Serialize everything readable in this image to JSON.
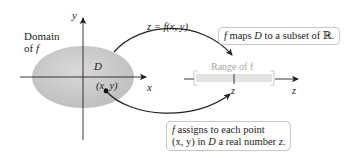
{
  "diagram": {
    "domain_label_line1": "Domain",
    "domain_label_line2_prefix": "of ",
    "domain_label_line2_var": "f",
    "region_label": "D",
    "point_label": "(x, y)",
    "x_axis_label": "x",
    "y_axis_label": "y",
    "z_axis_label": "z",
    "z_tick_label": "z",
    "mapping_label": "z = f(x, y)",
    "range_label": "Range of f",
    "callout_top": {
      "f": "f",
      "text1": " maps ",
      "D": "D",
      "text2": " to a subset of ℝ."
    },
    "callout_bottom": {
      "f": "f",
      "line1": " assigns to each point",
      "line2_xy": "(x, y)",
      "line2_mid": " in ",
      "line2_D": "D",
      "line2_end": " a real number ",
      "line2_z": "z",
      "line2_period": "."
    },
    "colors": {
      "domain_fill": "#c8c8c8",
      "range_bar": "#e2e2e2",
      "axis": "#222222",
      "range_text": "#a8a8a8"
    }
  }
}
